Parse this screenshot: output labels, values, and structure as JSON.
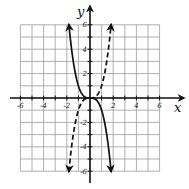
{
  "chart_data": {
    "type": "line",
    "title": "",
    "xlabel": "x",
    "ylabel": "y",
    "xlim": [
      -6,
      6
    ],
    "ylim": [
      -6,
      6
    ],
    "grid": true,
    "grid_step": 1,
    "x_tick_labels": [
      "-6",
      "-4",
      "-2",
      "2",
      "4",
      "6"
    ],
    "y_tick_labels": [
      "6",
      "4",
      "2",
      "-2",
      "-4",
      "-6"
    ],
    "x_ticks": [
      -6,
      -4,
      -2,
      2,
      4,
      6
    ],
    "y_ticks": [
      6,
      4,
      2,
      -2,
      -4,
      -6
    ],
    "series": [
      {
        "name": "solid curve",
        "style": "solid",
        "equation": "y = -x^3",
        "x": [
          -1.82,
          -1.5,
          -1.0,
          -0.5,
          0,
          0.5,
          1.0,
          1.5,
          1.82
        ],
        "y": [
          6.0,
          3.4,
          1.0,
          0.13,
          0,
          -0.13,
          -1.0,
          -3.4,
          -6.0
        ],
        "arrows": "both"
      },
      {
        "name": "dashed curve",
        "style": "dashed",
        "equation": "y = x^3",
        "x": [
          -1.82,
          -1.5,
          -1.0,
          -0.5,
          0,
          0.5,
          1.0,
          1.5,
          1.82
        ],
        "y": [
          -6.0,
          -3.4,
          -1.0,
          -0.13,
          0,
          0.13,
          1.0,
          3.4,
          6.0
        ],
        "arrows": "both"
      }
    ]
  },
  "axes": {
    "x_label": "x",
    "y_label": "y"
  }
}
